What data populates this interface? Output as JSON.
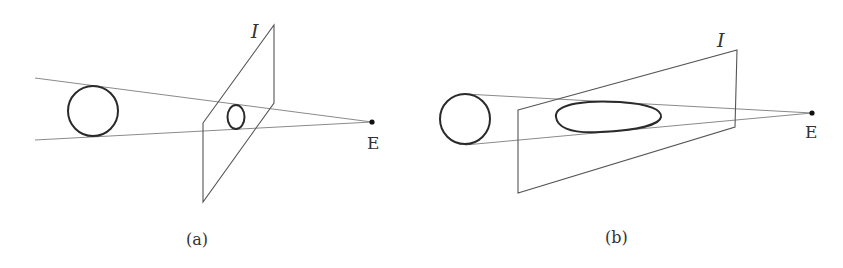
{
  "figure": {
    "panels": [
      {
        "id": "a",
        "caption": "(a)",
        "plane_label": "I",
        "eye_label": "E",
        "description": "Sphere projected onto image plane I placed near the eye: small, nearly circular image"
      },
      {
        "id": "b",
        "caption": "(b)",
        "plane_label": "I",
        "eye_label": "E",
        "description": "Sphere projected onto an oblique image plane I: elongated elliptical image"
      }
    ]
  }
}
